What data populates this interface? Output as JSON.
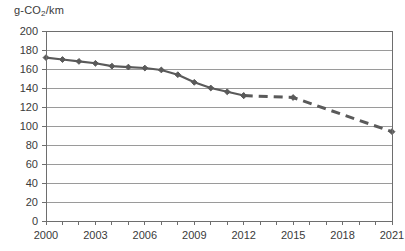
{
  "chart_data": {
    "type": "line",
    "title": "",
    "subtitle": "",
    "xlabel": "",
    "ylabel": "g-CO2/km",
    "ylabel_display": "g-CO₂/km",
    "xlim": [
      2000,
      2021
    ],
    "ylim": [
      0,
      200
    ],
    "ytick_step": 20,
    "xtick_step": 1,
    "xtick_label_step": 3,
    "grid": "horizontal",
    "legend": "none",
    "x": [
      2000,
      2001,
      2002,
      2003,
      2004,
      2005,
      2006,
      2007,
      2008,
      2009,
      2010,
      2011,
      2012,
      2015,
      2021
    ],
    "series": [
      {
        "name": "actual",
        "style": "solid",
        "color": "#5a5a5a",
        "marker": "diamond",
        "x": [
          2000,
          2001,
          2002,
          2003,
          2004,
          2005,
          2006,
          2007,
          2008,
          2009,
          2010,
          2011,
          2012
        ],
        "values": [
          172,
          170,
          168,
          166,
          163,
          162,
          161,
          159,
          154,
          146,
          140,
          136,
          132
        ]
      },
      {
        "name": "target",
        "style": "dashed",
        "color": "#5a5a5a",
        "marker": "diamond",
        "x": [
          2012,
          2015,
          2021
        ],
        "values": [
          132,
          130,
          94
        ]
      }
    ],
    "ytick_labels": [
      "200",
      "180",
      "160",
      "140",
      "120",
      "100",
      "80",
      "60",
      "40",
      "20",
      "0"
    ],
    "ytick_values": [
      200,
      180,
      160,
      140,
      120,
      100,
      80,
      60,
      40,
      20,
      0
    ],
    "xtick_values": [
      2000,
      2001,
      2002,
      2003,
      2004,
      2005,
      2006,
      2007,
      2008,
      2009,
      2010,
      2011,
      2012,
      2013,
      2014,
      2015,
      2016,
      2017,
      2018,
      2019,
      2020,
      2021
    ],
    "xtick_labels": [
      "2000",
      "",
      "",
      "2003",
      "",
      "",
      "2006",
      "",
      "",
      "2009",
      "",
      "",
      "2012",
      "",
      "",
      "2015",
      "",
      "",
      "2018",
      "",
      "",
      "2021"
    ],
    "colors": {
      "line": "#5a5a5a",
      "grid": "#9a9a9a",
      "axis": "#6e6e6e",
      "text": "#3a3a3a",
      "background": "#ffffff"
    }
  }
}
